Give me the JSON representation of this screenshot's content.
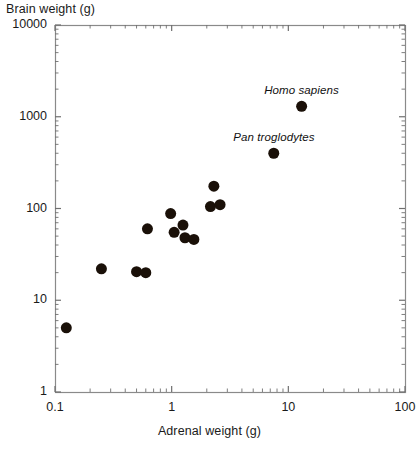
{
  "chart_data": {
    "type": "scatter",
    "title": "",
    "xlabel": "Adrenal weight (g)",
    "ylabel": "Brain weight (g)",
    "xscale": "log",
    "yscale": "log",
    "xlim": [
      0.1,
      100
    ],
    "ylim": [
      1,
      10000
    ],
    "grid": false,
    "legend": null,
    "xticks": [
      {
        "value": 0.1,
        "label": "0.1"
      },
      {
        "value": 1,
        "label": "1"
      },
      {
        "value": 10,
        "label": "10"
      },
      {
        "value": 100,
        "label": "100"
      }
    ],
    "yticks": [
      {
        "value": 1,
        "label": "1"
      },
      {
        "value": 10,
        "label": "10"
      },
      {
        "value": 100,
        "label": "100"
      },
      {
        "value": 1000,
        "label": "1000"
      },
      {
        "value": 10000,
        "label": "10000"
      }
    ],
    "marker": {
      "shape": "circle",
      "color": "#1a1008",
      "size_px": 11
    },
    "points": [
      {
        "x": 0.125,
        "y": 5.0,
        "label": ""
      },
      {
        "x": 0.25,
        "y": 22.0,
        "label": ""
      },
      {
        "x": 0.5,
        "y": 20.5,
        "label": ""
      },
      {
        "x": 0.6,
        "y": 20.0,
        "label": ""
      },
      {
        "x": 0.62,
        "y": 60.0,
        "label": ""
      },
      {
        "x": 0.98,
        "y": 88.0,
        "label": ""
      },
      {
        "x": 1.05,
        "y": 55.0,
        "label": ""
      },
      {
        "x": 1.25,
        "y": 66.0,
        "label": ""
      },
      {
        "x": 1.3,
        "y": 48.0,
        "label": ""
      },
      {
        "x": 1.55,
        "y": 46.0,
        "label": ""
      },
      {
        "x": 2.3,
        "y": 175.0,
        "label": ""
      },
      {
        "x": 2.15,
        "y": 105.0,
        "label": ""
      },
      {
        "x": 2.6,
        "y": 110.0,
        "label": ""
      },
      {
        "x": 7.5,
        "y": 400.0,
        "label": "Pan troglodytes"
      },
      {
        "x": 13.0,
        "y": 1300.0,
        "label": "Homo sapiens"
      }
    ],
    "annotations": [
      {
        "text": "Homo sapiens",
        "for_point_x": 13.0,
        "for_point_y": 1300.0,
        "style": "italic"
      },
      {
        "text": "Pan troglodytes",
        "for_point_x": 7.5,
        "for_point_y": 400.0,
        "style": "italic"
      }
    ]
  },
  "axes": {
    "frame_color": "#8a8a8a",
    "tick_color": "#6f6f6f"
  }
}
